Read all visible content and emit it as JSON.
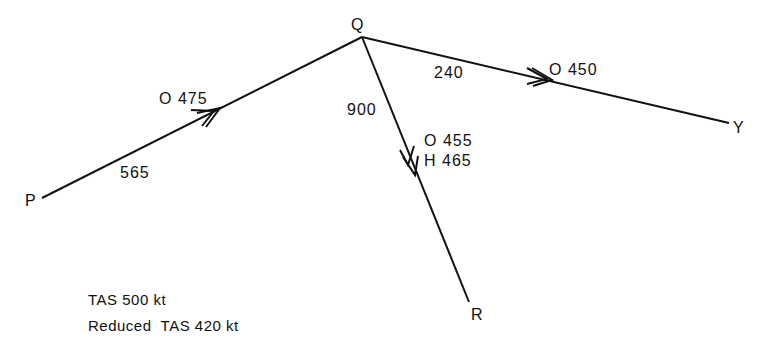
{
  "points": {
    "P": {
      "label": "P"
    },
    "Q": {
      "label": "Q"
    },
    "Y": {
      "label": "Y"
    },
    "R": {
      "label": "R"
    }
  },
  "legs": [
    {
      "from": "P",
      "to": "Q",
      "distance": "565",
      "track_label": "O 475"
    },
    {
      "from": "Q",
      "to": "Y",
      "distance": "240",
      "track_label": "O 450"
    },
    {
      "from": "Q",
      "to": "R",
      "distance": "900",
      "track_label_1": "O 455",
      "track_label_2": "H 465"
    }
  ],
  "notes": {
    "tas": "TAS 500 kt",
    "reduced_tas": "Reduced  TAS 420 kt"
  },
  "colors": {
    "line": "#111111",
    "background": "#ffffff"
  }
}
